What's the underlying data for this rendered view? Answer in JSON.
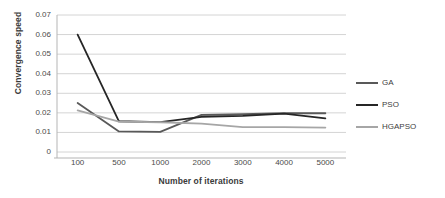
{
  "chart_data": {
    "type": "line",
    "title": "",
    "xlabel": "Number of iterations",
    "ylabel": "Convergence speed",
    "categories": [
      "100",
      "500",
      "1000",
      "2000",
      "3000",
      "4000",
      "5000"
    ],
    "x_tick_labels": [
      "100",
      "500",
      "1000",
      "2000",
      "3000",
      "4000",
      "5000"
    ],
    "y_tick_labels": [
      "0.07",
      "0.06",
      "0.05",
      "0.04",
      "0.03",
      "0.02",
      "0.01",
      "0"
    ],
    "y_tick_values": [
      0.07,
      0.06,
      0.05,
      0.04,
      0.03,
      0.02,
      0.01,
      0
    ],
    "ylim": [
      0,
      0.07
    ],
    "grid": "horizontal",
    "legend_position": "right",
    "series": [
      {
        "name": "GA",
        "color": "#595959",
        "values": [
          0.025,
          0.0105,
          0.0103,
          0.019,
          0.0193,
          0.0198,
          0.0198
        ]
      },
      {
        "name": "PSO",
        "color": "#262626",
        "values": [
          0.06,
          0.0157,
          0.0153,
          0.018,
          0.0185,
          0.0196,
          0.0172
        ]
      },
      {
        "name": "HGAPSO",
        "color": "#a6a6a6",
        "values": [
          0.0213,
          0.0155,
          0.0152,
          0.0145,
          0.0127,
          0.0127,
          0.0125
        ]
      }
    ]
  },
  "legend": {
    "items": [
      {
        "label": "GA",
        "color": "#595959"
      },
      {
        "label": "PSO",
        "color": "#262626"
      },
      {
        "label": "HGAPSO",
        "color": "#a6a6a6"
      }
    ]
  },
  "axes": {
    "y_title": "Convergence speed",
    "x_title": "Number of iterations"
  },
  "colors": {
    "gridline": "#d4d4d4",
    "axis_line": "#b5b5b5",
    "text": "#404040",
    "background": "#ffffff"
  }
}
